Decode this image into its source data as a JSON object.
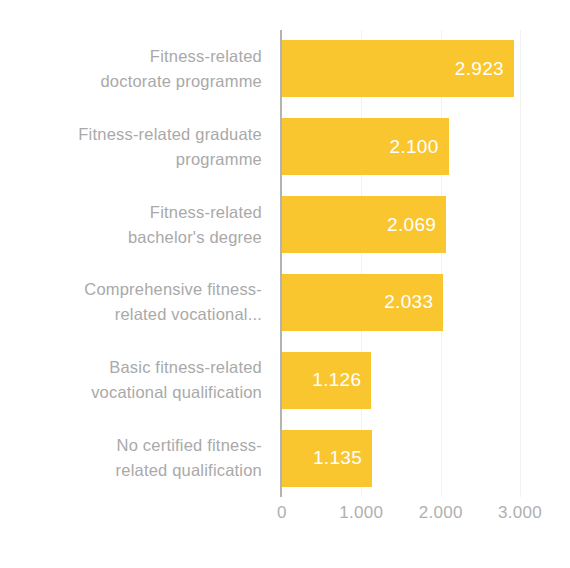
{
  "chart_data": {
    "type": "bar",
    "orientation": "horizontal",
    "title": "",
    "subtitle": "",
    "xlabel": "",
    "ylabel": "",
    "categories": [
      "Fitness-related doctorate programme",
      "Fitness-related graduate programme",
      "Fitness-related bachelor's degree",
      "Comprehensive fitness-related vocational...",
      "Basic fitness-related vocational qualification",
      "No certified fitness-related qualification"
    ],
    "values": [
      2923,
      2100,
      2069,
      2033,
      1126,
      1135
    ],
    "value_labels": [
      "2.923",
      "2.100",
      "2.069",
      "2.033",
      "1.126",
      "1.135"
    ],
    "xlim": [
      0,
      3000
    ],
    "xticks": [
      0,
      1000,
      2000,
      3000
    ],
    "xtick_labels": [
      "0",
      "1.000",
      "2.000",
      "3.000"
    ],
    "grid": true,
    "legend": false,
    "bar_color": "#fac62f",
    "value_label_color": "#ffffff",
    "category_label_color": "#a9a9a9",
    "axis_label_color": "#b0b0b0",
    "axis_line_color": "#b3b3b3",
    "background_color": "#ffffff",
    "category_label_lines": [
      [
        "Fitness-related",
        "doctorate programme"
      ],
      [
        "Fitness-related graduate",
        "programme"
      ],
      [
        "Fitness-related",
        "bachelor's degree"
      ],
      [
        "Comprehensive fitness-",
        "related vocational..."
      ],
      [
        "Basic fitness-related",
        "vocational qualification"
      ],
      [
        "No certified fitness-",
        "related qualification"
      ]
    ]
  }
}
